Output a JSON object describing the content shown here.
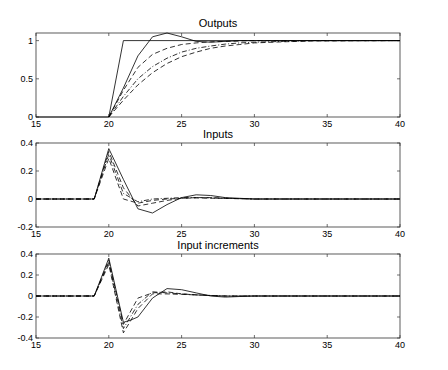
{
  "figure": {
    "width": 448,
    "height": 370,
    "background": "#ffffff",
    "line_color": "#000000"
  },
  "chart_data": [
    {
      "type": "line",
      "title": "Outputs",
      "xlabel": "",
      "ylabel": "",
      "xlim": [
        15,
        40
      ],
      "ylim": [
        0,
        1.1
      ],
      "xticks": [
        15,
        20,
        25,
        30,
        35,
        40
      ],
      "yticks": [
        0,
        0.5,
        1
      ],
      "ytick_labels": [
        "0",
        "0.5",
        "1"
      ],
      "grid": false,
      "legend": null,
      "box_px": {
        "left": 36,
        "right": 400,
        "top": 33,
        "bottom": 117
      },
      "series": [
        {
          "name": "reference",
          "style": "solid",
          "x": [
            15,
            20,
            21,
            40
          ],
          "y": [
            0,
            0,
            1,
            1
          ]
        },
        {
          "name": "response-1",
          "style": "solid",
          "x": [
            20,
            21,
            22,
            23,
            24,
            25,
            26,
            27,
            28,
            29,
            30,
            40
          ],
          "y": [
            0,
            0.38,
            0.8,
            1.05,
            1.1,
            1.05,
            0.99,
            0.98,
            0.99,
            1.0,
            1.0,
            1.0
          ]
        },
        {
          "name": "response-2",
          "style": "dashed",
          "x": [
            20,
            21,
            22,
            23,
            24,
            25,
            26,
            27,
            28,
            29,
            30,
            32,
            40
          ],
          "y": [
            0,
            0.35,
            0.65,
            0.82,
            0.9,
            0.95,
            0.97,
            0.985,
            0.99,
            0.995,
            1.0,
            1.0,
            1.0
          ]
        },
        {
          "name": "response-3",
          "style": "dashdot",
          "x": [
            20,
            21,
            22,
            23,
            24,
            25,
            26,
            27,
            28,
            29,
            30,
            32,
            34,
            40
          ],
          "y": [
            0,
            0.27,
            0.5,
            0.66,
            0.77,
            0.85,
            0.9,
            0.93,
            0.955,
            0.97,
            0.98,
            0.99,
            1.0,
            1.0
          ]
        },
        {
          "name": "response-4",
          "style": "dashed",
          "x": [
            20,
            21,
            22,
            23,
            24,
            25,
            26,
            27,
            28,
            29,
            30,
            32,
            34,
            40
          ],
          "y": [
            0,
            0.22,
            0.42,
            0.58,
            0.7,
            0.79,
            0.85,
            0.9,
            0.93,
            0.95,
            0.97,
            0.985,
            0.995,
            1.0
          ]
        }
      ]
    },
    {
      "type": "line",
      "title": "Inputs",
      "xlabel": "",
      "ylabel": "",
      "xlim": [
        15,
        40
      ],
      "ylim": [
        -0.2,
        0.4
      ],
      "xticks": [
        15,
        20,
        25,
        30,
        35,
        40
      ],
      "yticks": [
        -0.2,
        0,
        0.2,
        0.4
      ],
      "ytick_labels": [
        "-0.2",
        "0",
        "0.2",
        "0.4"
      ],
      "grid": false,
      "legend": null,
      "box_px": {
        "left": 36,
        "right": 400,
        "top": 143,
        "bottom": 227
      },
      "series": [
        {
          "name": "input-1",
          "style": "solid",
          "x": [
            15,
            19,
            20,
            21,
            22,
            23,
            24,
            25,
            26,
            27,
            28,
            29,
            30,
            40
          ],
          "y": [
            0,
            0,
            0.36,
            0.14,
            -0.07,
            -0.1,
            -0.04,
            0.01,
            0.03,
            0.025,
            0.01,
            0.005,
            0,
            0
          ]
        },
        {
          "name": "input-2",
          "style": "dashed",
          "x": [
            15,
            19,
            20,
            21,
            22,
            23,
            24,
            25,
            26,
            27,
            28,
            30,
            40
          ],
          "y": [
            0,
            0,
            0.34,
            0.08,
            -0.05,
            -0.03,
            -0.01,
            0.005,
            0.01,
            0.01,
            0.005,
            0,
            0
          ]
        },
        {
          "name": "input-3",
          "style": "dashdot",
          "x": [
            15,
            19,
            20,
            21,
            22,
            23,
            24,
            25,
            26,
            27,
            28,
            30,
            40
          ],
          "y": [
            0,
            0,
            0.32,
            0.04,
            -0.02,
            0,
            0.005,
            0.01,
            0.01,
            0.008,
            0.005,
            0,
            0
          ]
        },
        {
          "name": "input-4",
          "style": "dashed",
          "x": [
            15,
            19,
            20,
            21,
            22,
            23,
            24,
            25,
            26,
            27,
            28,
            30,
            40
          ],
          "y": [
            0,
            0,
            0.29,
            0.0,
            -0.03,
            -0.01,
            0.0,
            0.005,
            0.008,
            0.006,
            0.004,
            0,
            0
          ]
        }
      ]
    },
    {
      "type": "line",
      "title": "Input increments",
      "xlabel": "",
      "ylabel": "",
      "xlim": [
        15,
        40
      ],
      "ylim": [
        -0.4,
        0.4
      ],
      "xticks": [
        15,
        20,
        25,
        30,
        35,
        40
      ],
      "yticks": [
        -0.4,
        -0.2,
        0,
        0.2,
        0.4
      ],
      "ytick_labels": [
        "-0.4",
        "-0.2",
        "0",
        "0.2",
        "0.4"
      ],
      "grid": false,
      "legend": null,
      "box_px": {
        "left": 36,
        "right": 400,
        "top": 254,
        "bottom": 338
      },
      "series": [
        {
          "name": "increment-1",
          "style": "solid",
          "x": [
            15,
            19,
            20,
            21,
            21.5,
            22,
            23,
            24,
            25,
            26,
            27,
            28,
            29,
            30,
            40
          ],
          "y": [
            0,
            0,
            0.36,
            -0.25,
            -0.23,
            -0.2,
            -0.02,
            0.07,
            0.06,
            0.03,
            0.0,
            -0.01,
            -0.005,
            0,
            0
          ]
        },
        {
          "name": "increment-2",
          "style": "dashed",
          "x": [
            15,
            19,
            20,
            21,
            22,
            23,
            24,
            25,
            26,
            27,
            28,
            30,
            40
          ],
          "y": [
            0,
            0,
            0.34,
            -0.27,
            -0.02,
            0.03,
            0.04,
            0.02,
            0.01,
            0.005,
            0,
            0,
            0
          ]
        },
        {
          "name": "increment-3",
          "style": "dashdot",
          "x": [
            15,
            19,
            20,
            21,
            22,
            23,
            24,
            25,
            26,
            27,
            28,
            30,
            40
          ],
          "y": [
            0,
            0,
            0.32,
            -0.31,
            -0.08,
            0.04,
            0.03,
            0.02,
            0.01,
            0.005,
            0,
            0,
            0
          ]
        },
        {
          "name": "increment-4",
          "style": "dashed",
          "x": [
            15,
            19,
            20,
            21,
            22,
            23,
            24,
            25,
            26,
            27,
            28,
            30,
            40
          ],
          "y": [
            0,
            0,
            0.3,
            -0.35,
            -0.12,
            0.02,
            0.02,
            0.015,
            0.01,
            0.005,
            0,
            0,
            0
          ]
        }
      ]
    }
  ]
}
